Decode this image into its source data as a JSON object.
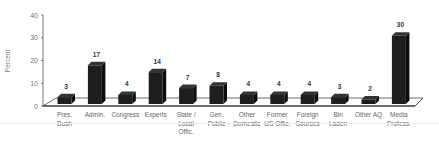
{
  "chart_data": {
    "type": "bar",
    "title": "",
    "xlabel": "",
    "ylabel": "Percent",
    "ylim": [
      0,
      40
    ],
    "yticks": [
      0,
      10,
      20,
      30,
      40
    ],
    "grid": false,
    "legend": null,
    "style": "3d-column",
    "bar_color": "#1e1e1e",
    "categories": [
      [
        "Pres.",
        "Bush"
      ],
      [
        "Admin."
      ],
      [
        "Congress"
      ],
      [
        "Experts"
      ],
      [
        "State /",
        "Local",
        "Offic."
      ],
      [
        "Gen.",
        "Public"
      ],
      [
        "Other",
        "Domestic"
      ],
      [
        "Former",
        "US Offic."
      ],
      [
        "Foreign",
        "Sources"
      ],
      [
        "Bin",
        "Laden"
      ],
      [
        "Other AQ"
      ],
      [
        "Media",
        "Profess."
      ]
    ],
    "values": [
      3,
      17,
      4,
      14,
      7,
      8,
      4,
      4,
      4,
      3,
      2,
      30
    ]
  }
}
